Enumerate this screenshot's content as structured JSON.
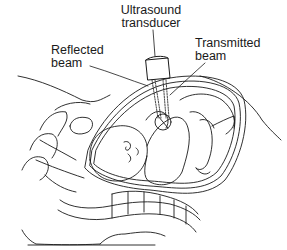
{
  "figure": {
    "labels": {
      "transducer_line1": "Ultrasound",
      "transducer_line2": "transducer",
      "reflected_line1": "Reflected",
      "reflected_line2": "beam",
      "transmitted_line1": "Transmitted",
      "transmitted_line2": "beam"
    },
    "colors": {
      "line": "#1a1a1a",
      "background": "#ffffff"
    }
  }
}
